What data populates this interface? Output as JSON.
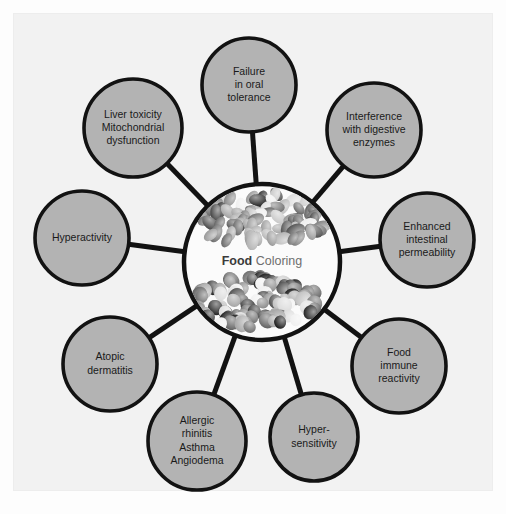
{
  "figure": {
    "title": "Food Coloring",
    "background_color": "#f2f2f2",
    "page_background_color": "#fdfdfd",
    "node_fill_color": "#b3b3b3",
    "node_stroke_color": "#121212",
    "center_fill_color": "#fbfbfb",
    "connector_color": "#121212"
  },
  "center": {
    "label_bold": "Food",
    "label_light": " Coloring",
    "image_top": "jelly-beans-pile-photo",
    "image_bottom": "candy-buttons-pile-photo"
  },
  "nodes": [
    {
      "id": "failure-in-oral-tolerance",
      "lines": [
        "Failure",
        "in oral",
        "tolerance"
      ],
      "cx": 249,
      "cy": 85,
      "r": 47
    },
    {
      "id": "interference-with-digestive-enzymes",
      "lines": [
        "Interference",
        "with digestive",
        "enzymes"
      ],
      "cx": 374,
      "cy": 130,
      "r": 47
    },
    {
      "id": "enhanced-intestinal-permeability",
      "lines": [
        "Enhanced",
        "intestinal",
        "permeability"
      ],
      "cx": 427,
      "cy": 240,
      "r": 47
    },
    {
      "id": "food-immune-reactivity",
      "lines": [
        "Food",
        "immune",
        "reactivity"
      ],
      "cx": 399,
      "cy": 366,
      "r": 47
    },
    {
      "id": "hyper-sensitivity",
      "lines": [
        "Hyper-",
        "sensitivity"
      ],
      "cx": 314,
      "cy": 437,
      "r": 44
    },
    {
      "id": "allergic-rhinitis-asthma-angiodema",
      "lines": [
        "Allergic",
        "rhinitis",
        "Asthma",
        "Angiodema"
      ],
      "cx": 197,
      "cy": 441,
      "r": 49
    },
    {
      "id": "atopic-dermatitis",
      "lines": [
        "Atopic",
        "dermatitis"
      ],
      "cx": 110,
      "cy": 364,
      "r": 47
    },
    {
      "id": "hyperactivity",
      "lines": [
        "Hyperactivity"
      ],
      "cx": 82,
      "cy": 238,
      "r": 47
    },
    {
      "id": "liver-toxicity-mitochondrial-dysfunction",
      "lines": [
        "Liver toxicity",
        "Mitochondrial",
        "dysfunction"
      ],
      "cx": 133,
      "cy": 128,
      "r": 49
    }
  ],
  "center_geometry": {
    "cx": 262,
    "cy": 262,
    "r": 78
  }
}
